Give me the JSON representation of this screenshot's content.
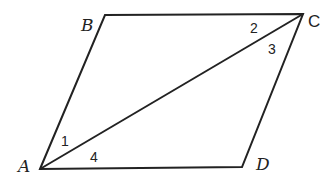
{
  "figure": {
    "type": "parallelogram with diagonal",
    "vertices": {
      "A": {
        "label": "A",
        "x": 40,
        "y": 169
      },
      "B": {
        "label": "B",
        "x": 105,
        "y": 15
      },
      "C": {
        "label": "C",
        "x": 303,
        "y": 14
      },
      "D": {
        "label": "D",
        "x": 242,
        "y": 167
      }
    },
    "diagonal": "AC",
    "angle_labels": [
      {
        "label": "1",
        "at": "A",
        "between": "AB, AC"
      },
      {
        "label": "2",
        "at": "C",
        "between": "CB, CA"
      },
      {
        "label": "3",
        "at": "C",
        "between": "CA, CD"
      },
      {
        "label": "4",
        "at": "A",
        "between": "AC, AD"
      }
    ],
    "stroke_color": "#222222"
  }
}
